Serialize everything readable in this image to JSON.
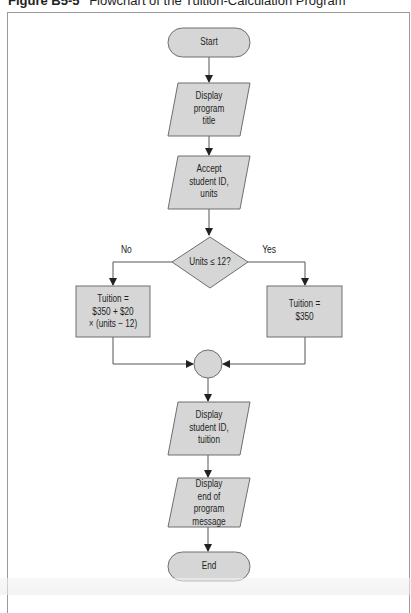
{
  "caption": {
    "figure_number": "Figure B5-5",
    "title": "Flowchart of the Tuition-Calculation Program"
  },
  "colors": {
    "shape_fill": "#d6d6d6",
    "shape_stroke": "#6e6e6e",
    "line": "#555555",
    "frame": "#9a9a9a"
  },
  "flowchart": {
    "nodes": [
      {
        "id": "start",
        "type": "terminal",
        "label": "Start"
      },
      {
        "id": "display_title",
        "type": "io",
        "label": [
          "Display",
          "program",
          "title"
        ]
      },
      {
        "id": "accept_input",
        "type": "io",
        "label": [
          "Accept",
          "student ID,",
          "units"
        ]
      },
      {
        "id": "decision",
        "type": "decision",
        "label": "Units ≤ 12?"
      },
      {
        "id": "calc_no",
        "type": "process",
        "label": [
          "Tuition =",
          "$350 + $20",
          "× (units − 12)"
        ]
      },
      {
        "id": "calc_yes",
        "type": "process",
        "label": [
          "Tuition =",
          "$350"
        ]
      },
      {
        "id": "connector",
        "type": "connector",
        "label": ""
      },
      {
        "id": "display_result",
        "type": "io",
        "label": [
          "Display",
          "student ID,",
          "tuition"
        ]
      },
      {
        "id": "display_end",
        "type": "io",
        "label": [
          "Display",
          "end of",
          "program",
          "message"
        ]
      },
      {
        "id": "end",
        "type": "terminal",
        "label": "End"
      }
    ],
    "edges": [
      {
        "from": "start",
        "to": "display_title"
      },
      {
        "from": "display_title",
        "to": "accept_input"
      },
      {
        "from": "accept_input",
        "to": "decision"
      },
      {
        "from": "decision",
        "to": "calc_no",
        "label": "No"
      },
      {
        "from": "decision",
        "to": "calc_yes",
        "label": "Yes"
      },
      {
        "from": "calc_no",
        "to": "connector"
      },
      {
        "from": "calc_yes",
        "to": "connector"
      },
      {
        "from": "connector",
        "to": "display_result"
      },
      {
        "from": "display_result",
        "to": "display_end"
      },
      {
        "from": "display_end",
        "to": "end"
      }
    ],
    "branch_labels": {
      "no": "No",
      "yes": "Yes"
    }
  }
}
